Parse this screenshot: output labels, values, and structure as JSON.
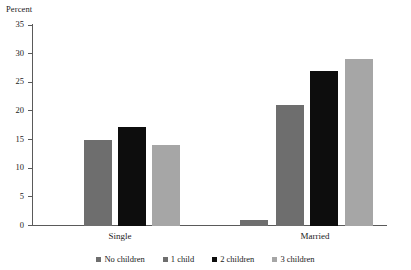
{
  "chart_data": {
    "type": "bar",
    "title": "",
    "xlabel": "",
    "ylabel": "Percent",
    "ylim": [
      0,
      35
    ],
    "yticks": [
      0,
      5,
      10,
      15,
      20,
      25,
      30,
      35
    ],
    "ytick_labels": [
      "0",
      "5",
      "10",
      "15",
      "20",
      "25",
      "30",
      "35"
    ],
    "grid": false,
    "legend_position": "bottom",
    "categories": [
      "Single",
      "Married"
    ],
    "series": [
      {
        "name": "No children",
        "color": "#6e6e6e",
        "values": [
          null,
          1.0
        ]
      },
      {
        "name": "1 child",
        "color": "#6e6e6e",
        "values": [
          15.1,
          21.2
        ]
      },
      {
        "name": "2 children",
        "color": "#0d0d0d",
        "values": [
          17.2,
          27.0
        ]
      },
      {
        "name": "3 children",
        "color": "#a6a6a6",
        "values": [
          14.2,
          29.2
        ]
      }
    ],
    "legend_entries": [
      {
        "label": "No children",
        "color": "#6e6e6e"
      },
      {
        "label": "1 child",
        "color": "#6e6e6e"
      },
      {
        "label": "2 children",
        "color": "#0d0d0d"
      },
      {
        "label": "3 children",
        "color": "#a6a6a6"
      }
    ]
  },
  "colors": {
    "axis": "#5a5a5a",
    "text": "#1a1a1a",
    "background": "#ffffff",
    "medium_gray": "#6e6e6e",
    "black": "#0d0d0d",
    "light_gray": "#a6a6a6"
  }
}
